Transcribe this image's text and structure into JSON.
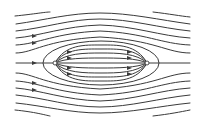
{
  "diagram": {
    "type": "streamlines",
    "stroke_color": "#3a3a3a",
    "background": "#ffffff",
    "axis_y": 63,
    "source": {
      "x": 55,
      "y": 63
    },
    "sink": {
      "x": 147,
      "y": 63
    },
    "oval": {
      "cx": 101,
      "cy": 63,
      "rx": 58,
      "ry": 22
    }
  }
}
